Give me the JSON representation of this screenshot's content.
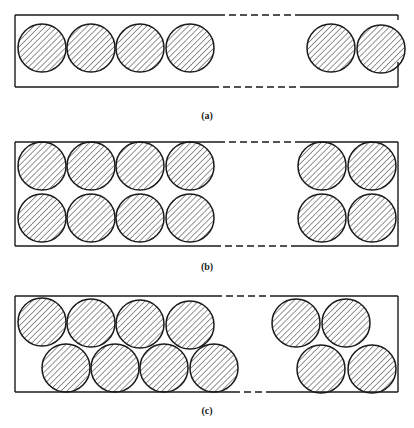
{
  "figure": {
    "stroke_color": "#1a1a1a",
    "hatch_color": "#2a2a2a",
    "background": "#ffffff",
    "circle_radius": 24,
    "panels": [
      {
        "id": "a",
        "label": "(a)",
        "label_pos": [
          207,
          117
        ],
        "box": {
          "left": 15,
          "right": 398,
          "top": 15,
          "bottom": 87,
          "top_solid_end": 218,
          "bottom_solid_end": 212,
          "dash_end": 300,
          "right_gap": [
            20,
            62
          ]
        },
        "circles": [
          [
            42,
            48
          ],
          [
            91,
            48
          ],
          [
            140,
            48
          ],
          [
            190,
            48
          ],
          [
            331,
            48
          ],
          [
            381,
            49
          ]
        ]
      },
      {
        "id": "b",
        "label": "(b)",
        "label_pos": [
          207,
          268
        ],
        "box": {
          "left": 15,
          "right": 398,
          "top": 142,
          "bottom": 246,
          "top_solid_end": 218,
          "bottom_solid_end": 214,
          "dash_end": 296,
          "right_gap": null
        },
        "circles": [
          [
            42,
            166
          ],
          [
            91,
            166
          ],
          [
            140,
            166
          ],
          [
            190,
            166
          ],
          [
            42,
            218
          ],
          [
            91,
            218
          ],
          [
            140,
            218
          ],
          [
            190,
            218
          ],
          [
            322,
            166
          ],
          [
            372,
            166
          ],
          [
            322,
            218
          ],
          [
            372,
            218
          ]
        ]
      },
      {
        "id": "c",
        "label": "(c)",
        "label_pos": [
          207,
          412
        ],
        "box": {
          "left": 15,
          "right": 398,
          "top": 296,
          "bottom": 392,
          "top_solid_end": 215,
          "bottom_solid_end": 233,
          "dash_end": 272,
          "right_gap": null
        },
        "circles": [
          [
            42,
            322
          ],
          [
            91,
            323
          ],
          [
            140,
            324
          ],
          [
            190,
            325
          ],
          [
            66,
            368
          ],
          [
            115,
            368
          ],
          [
            164,
            368
          ],
          [
            214,
            368
          ],
          [
            296,
            323
          ],
          [
            346,
            323
          ],
          [
            321,
            369
          ],
          [
            372,
            369
          ]
        ]
      }
    ]
  }
}
